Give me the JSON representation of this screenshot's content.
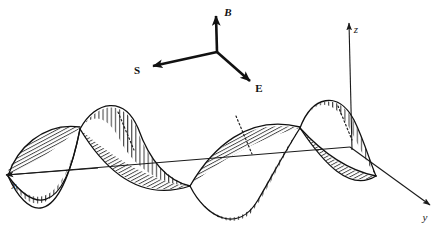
{
  "figure": {
    "title": "Electromagnetic wave propagation diagram",
    "background_color": "#ffffff",
    "line_color": "#111111",
    "width": 443,
    "height": 236
  },
  "axes": [
    {
      "id": "x",
      "label": "x",
      "direction": "left",
      "label_x": 14,
      "label_y": 189,
      "arrow_tip_x": 6,
      "arrow_tip_y": 175
    },
    {
      "id": "y",
      "label": "y",
      "direction": "down-right",
      "label_x": 425,
      "label_y": 221,
      "arrow_tip_x": 430,
      "arrow_tip_y": 205
    },
    {
      "id": "z",
      "label": "z",
      "direction": "up",
      "label_x": 356,
      "label_y": 33,
      "arrow_tip_x": 349,
      "arrow_tip_y": 23
    }
  ],
  "vectors": [
    {
      "id": "B",
      "label": "B",
      "style": "bold-italic",
      "direction": "up",
      "label_x": 228,
      "label_y": 16,
      "tip_x": 216,
      "tip_y": 12,
      "tail_x": 217,
      "tail_y": 52
    },
    {
      "id": "S",
      "label": "S",
      "style": "bold",
      "direction": "left",
      "label_x": 137,
      "label_y": 74,
      "tip_x": 148,
      "tip_y": 67,
      "tail_x": 217,
      "tail_y": 52
    },
    {
      "id": "E",
      "label": "E",
      "style": "bold",
      "direction": "down-right",
      "label_x": 259,
      "label_y": 92,
      "tip_x": 253,
      "tip_y": 84,
      "tail_x": 217,
      "tail_y": 52
    }
  ],
  "vector_origin": {
    "x": 217,
    "y": 52
  },
  "waves": [
    {
      "id": "electric-field-wave",
      "plane": "vertical",
      "hatching": "vertical-lines",
      "description": "Transverse sinusoidal sheet drawn in the vertical plane with vertical hatch lines"
    },
    {
      "id": "magnetic-field-wave",
      "plane": "tilted",
      "hatching": "diagonal-lines",
      "description": "Transverse sinusoidal sheet drawn in the tilted plane with fine diagonal hatch lines"
    }
  ],
  "propagation_axis": {
    "start_x": 6,
    "start_y": 175,
    "end_x": 430,
    "end_y": 205,
    "node_positions": [
      80,
      190,
      300
    ]
  }
}
